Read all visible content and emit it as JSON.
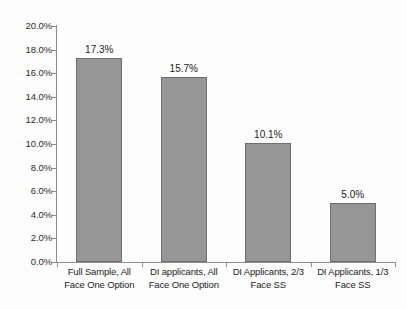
{
  "chart_data": {
    "type": "bar",
    "title": "",
    "subtitle": "",
    "xlabel": "",
    "ylabel": "",
    "ylim": [
      0,
      20
    ],
    "grid": false,
    "legend": false,
    "legend_position": "none",
    "categories": [
      "Full Sample, All Face One Option",
      "DI applicants, All Face One Option",
      "DI Applicants, 2/3 Face SS",
      "DI Applicants, 1/3 Face SS"
    ],
    "category_lines": [
      [
        "Full Sample, All",
        "Face One Option"
      ],
      [
        "DI applicants, All",
        "Face One Option"
      ],
      [
        "DI Applicants, 2/3",
        "Face SS"
      ],
      [
        "DI Applicants, 1/3",
        "Face SS"
      ]
    ],
    "values": [
      17.3,
      15.7,
      10.1,
      5.0
    ],
    "value_labels": [
      "17.3%",
      "15.7%",
      "10.1%",
      "5.0%"
    ],
    "ytick_values": [
      0,
      2,
      4,
      6,
      8,
      10,
      12,
      14,
      16,
      18,
      20
    ],
    "ytick_labels": [
      "0.0%",
      "2.0%",
      "4.0%",
      "6.0%",
      "8.0%",
      "10.0%",
      "12.0%",
      "14.0%",
      "16.0%",
      "18.0%",
      "20.0%"
    ],
    "bar_color": "#969696",
    "bar_border_color": "#6f6f6f",
    "axis_color": "#8d8d8d",
    "text_color": "#1c1c1c"
  }
}
